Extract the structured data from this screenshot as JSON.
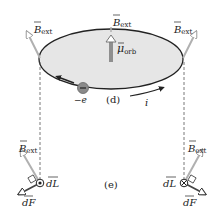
{
  "figure": {
    "panel_d": {
      "label": "(d)",
      "loop_fill": "#e6e6e6",
      "loop_stroke": "#222222",
      "electron": {
        "label": "−e",
        "color": "#8a8a8a"
      },
      "current": {
        "label": "i"
      },
      "magnetic_moment": {
        "symbol": "μ",
        "subscript": "orb",
        "color": "#8f8f8f"
      },
      "field_vectors": [
        {
          "symbol": "B",
          "subscript": "ext",
          "position": "left"
        },
        {
          "symbol": "B",
          "subscript": "ext",
          "position": "center"
        },
        {
          "symbol": "B",
          "subscript": "ext",
          "position": "right"
        }
      ],
      "field_color": "#b3b3b3"
    },
    "panel_e": {
      "label": "(e)",
      "left": {
        "field": {
          "symbol": "B",
          "subscript": "ext"
        },
        "dL": {
          "label": "dL",
          "direction": "out of page"
        },
        "dF": {
          "label": "dF"
        }
      },
      "right": {
        "field": {
          "symbol": "B",
          "subscript": "ext"
        },
        "dL": {
          "label": "dL",
          "direction": "into page"
        },
        "dF": {
          "label": "dF"
        }
      }
    }
  }
}
